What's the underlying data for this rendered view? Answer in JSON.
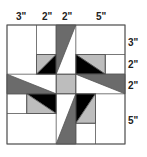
{
  "diagram": {
    "top_labels": [
      {
        "text": "3\"",
        "x": 22
      },
      {
        "text": "2\"",
        "x": 46
      },
      {
        "text": "2\"",
        "x": 66
      },
      {
        "text": "5\"",
        "x": 100
      }
    ],
    "right_labels": [
      {
        "text": "3\"",
        "y": 43
      },
      {
        "text": "2\"",
        "y": 66
      },
      {
        "text": "2\"",
        "y": 86
      },
      {
        "text": "5\"",
        "y": 121
      }
    ],
    "colors": {
      "dark_gray": "#6b6b6b",
      "light_gray": "#bdbdbd",
      "black": "#000000",
      "white": "#ffffff",
      "line": "#555555"
    },
    "block_size_inches": 12
  }
}
